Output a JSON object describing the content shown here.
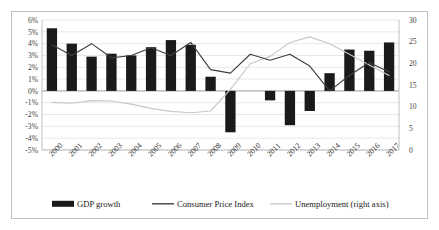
{
  "chart_data": {
    "type": "bar",
    "title": "",
    "subtitle": "",
    "xlabel": "",
    "ylabel": "",
    "ylabel_right": "",
    "grid": true,
    "legend_position": "bottom",
    "categories": [
      "2000",
      "2001",
      "2002",
      "2003",
      "2004",
      "2005",
      "2006",
      "2007",
      "2008",
      "2009",
      "2010",
      "2011",
      "2012",
      "2013",
      "2014",
      "2015",
      "2016",
      "2017"
    ],
    "ylim": [
      -5,
      6
    ],
    "yticks": [
      "-5%",
      "-4%",
      "-3%",
      "-2%",
      "-1%",
      "0%",
      "1%",
      "2%",
      "3%",
      "4%",
      "5%",
      "6%"
    ],
    "ytick_values": [
      -5,
      -4,
      -3,
      -2,
      -1,
      0,
      1,
      2,
      3,
      4,
      5,
      6
    ],
    "ylim_right": [
      0,
      30
    ],
    "yticks_right": [
      "0",
      "5",
      "10",
      "15",
      "20",
      "25",
      "30"
    ],
    "ytick_values_right": [
      0,
      5,
      10,
      15,
      20,
      25,
      30
    ],
    "series": [
      {
        "name": "GDP growth",
        "kind": "bar",
        "axis": "left",
        "color": "#1a1a1a",
        "values": [
          5.3,
          4.0,
          2.9,
          3.15,
          3.0,
          3.7,
          4.3,
          3.9,
          1.2,
          -3.5,
          0.0,
          -0.8,
          -2.9,
          -1.7,
          1.5,
          3.5,
          3.4,
          4.1
        ]
      },
      {
        "name": "Consumer Price Index",
        "kind": "line",
        "axis": "left",
        "color": "#404040",
        "values": [
          3.9,
          3.0,
          4.0,
          2.8,
          3.0,
          3.65,
          3.0,
          4.1,
          1.8,
          1.5,
          3.1,
          2.6,
          3.1,
          2.1,
          0.0,
          1.3,
          2.4,
          1.6
        ]
      },
      {
        "name": "Unemployment (right axis)",
        "kind": "line",
        "axis": "right",
        "color": "#c8c8c8",
        "values": [
          11.0,
          10.8,
          11.4,
          11.3,
          10.6,
          9.6,
          8.9,
          8.6,
          9.0,
          14.0,
          19.9,
          21.6,
          24.8,
          26.1,
          24.5,
          22.1,
          19.6,
          17.2
        ]
      }
    ],
    "legend": [
      {
        "label": "GDP growth",
        "marker": "bar",
        "color": "#1a1a1a"
      },
      {
        "label": "Consumer Price Index",
        "marker": "line",
        "color": "#404040"
      },
      {
        "label": "Unemployment (right axis)",
        "marker": "line",
        "color": "#c8c8c8"
      }
    ]
  }
}
